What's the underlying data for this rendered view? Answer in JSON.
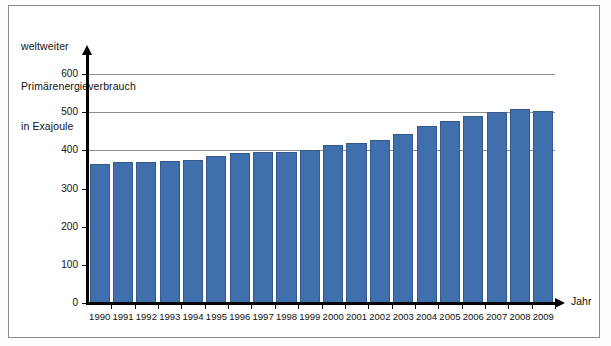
{
  "figure": {
    "background_color": "#ffffff",
    "frame_color": "#8a8a8a"
  },
  "title": {
    "line1": "weltweiter",
    "line2": "Primärenergieverbrauch",
    "line3": "in Exajoule"
  },
  "axes": {
    "x_axis_title": "Jahr",
    "y_tick_labels": [
      "0",
      "100",
      "200",
      "300",
      "400",
      "500",
      "600"
    ]
  },
  "chart_data": {
    "type": "bar",
    "title": "weltweiter Primärenergieverbrauch in Exajoule",
    "xlabel": "Jahr",
    "ylabel": "in Exajoule",
    "ylim": [
      0,
      600
    ],
    "yticks": [
      0,
      100,
      200,
      300,
      400,
      500,
      600
    ],
    "gridlines": [
      400,
      500,
      600
    ],
    "grid": true,
    "legend": "none",
    "bar_color": "#3f6fad",
    "bar_edge_color": "#35598b",
    "categories": [
      "1990",
      "1991",
      "1992",
      "1993",
      "1994",
      "1995",
      "1996",
      "1997",
      "1998",
      "1999",
      "2000",
      "2001",
      "2002",
      "2003",
      "2004",
      "2005",
      "2006",
      "2007",
      "2008",
      "2009"
    ],
    "values": [
      365,
      370,
      369,
      371,
      375,
      385,
      393,
      396,
      396,
      402,
      414,
      418,
      428,
      443,
      464,
      477,
      490,
      500,
      509,
      504
    ]
  }
}
